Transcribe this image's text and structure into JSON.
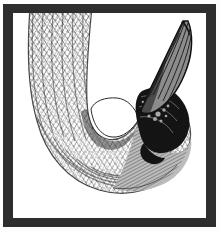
{
  "plate": {
    "kind": "engraving-illustration",
    "subject": "penguin head and neck",
    "style": "cross-hatched line engraving",
    "orientation": "hooked / J-shaped curve opening to upper right",
    "background_color": "#ffffff",
    "ink_color": "#1d1d1d",
    "frame": {
      "border_color": "#2e2e2e",
      "outer_rim_color": "#fdfdfd",
      "mat_color": "#ffffff",
      "border_width_px": 10
    },
    "canvas": {
      "width_px": 220,
      "height_px": 232
    },
    "regions": [
      {
        "name": "neck-and-nape",
        "tone": "mid-gray stipple",
        "fill": "#8e8e8e",
        "description": "broad hooked band of fine hatching sweeping from top-left down and around to the right"
      },
      {
        "name": "cheek-and-throat",
        "tone": "light gray hatching",
        "fill": "#a9a9a9",
        "description": "lower right mass of the head beneath the dark crown"
      },
      {
        "name": "crown-and-eye-patch",
        "tone": "solid black",
        "fill": "#151515",
        "description": "dense black blotch at the right, the dark crown and face patch"
      },
      {
        "name": "beak",
        "tone": "fine parallel line shading",
        "fill": "#5a5a5a",
        "description": "long tapering bill angled up to the top right corner"
      },
      {
        "name": "negative-space",
        "tone": "paper white",
        "fill": "#ffffff",
        "description": "the open white field inside the hook and around the figure"
      }
    ]
  },
  "labels": {
    "title": "",
    "caption": "",
    "watermark": ""
  }
}
